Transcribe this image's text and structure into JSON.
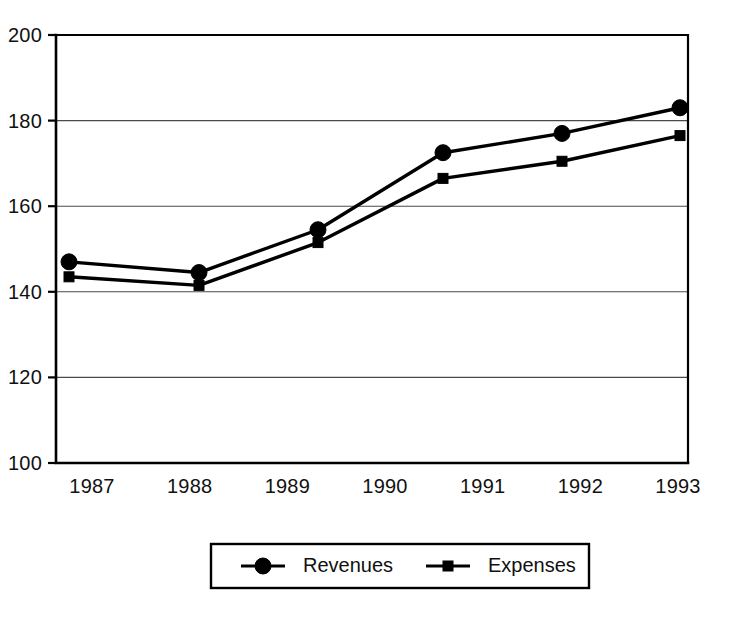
{
  "chart_data": {
    "type": "line",
    "title": "",
    "subtitle": "",
    "xlabel": "",
    "ylabel": "",
    "ylim": [
      100,
      200
    ],
    "y_ticks": [
      100,
      120,
      140,
      160,
      180,
      200
    ],
    "grid": "horizontal",
    "grid_values": [
      120,
      140,
      160,
      180
    ],
    "categories": [
      "1987",
      "1988",
      "1989",
      "1990",
      "1991",
      "1992",
      "1993"
    ],
    "x_tick_labels": [
      "1987",
      "1988",
      "1989",
      "1990",
      "1991",
      "1992",
      "1993"
    ],
    "legend_position": "bottom",
    "series": [
      {
        "name": "Revenues",
        "marker": "circle",
        "color": "#000000",
        "x": [
          "1987",
          "1988",
          "1989",
          "1990",
          "1991",
          "1993"
        ],
        "values": [
          147,
          144.5,
          154.5,
          172.5,
          177,
          183
        ]
      },
      {
        "name": "Expenses",
        "marker": "square",
        "color": "#000000",
        "x": [
          "1987",
          "1988",
          "1989",
          "1990",
          "1991",
          "1993"
        ],
        "values": [
          143.5,
          141.5,
          151.5,
          166.5,
          170.5,
          176.5
        ]
      }
    ]
  },
  "legend": {
    "items": [
      {
        "label": "Revenues",
        "marker": "circle"
      },
      {
        "label": "Expenses",
        "marker": "square"
      }
    ]
  },
  "geometry": {
    "plot_left": 56,
    "plot_right": 688,
    "plot_top": 35,
    "plot_bottom": 463,
    "marker_x": [
      69,
      199,
      318,
      443,
      562,
      680
    ],
    "legend_rect": {
      "x": 211,
      "y": 544,
      "w": 378,
      "h": 44
    }
  },
  "colors": {
    "ink": "#000000",
    "grid": "#4a4a4a",
    "background": "#ffffff"
  }
}
